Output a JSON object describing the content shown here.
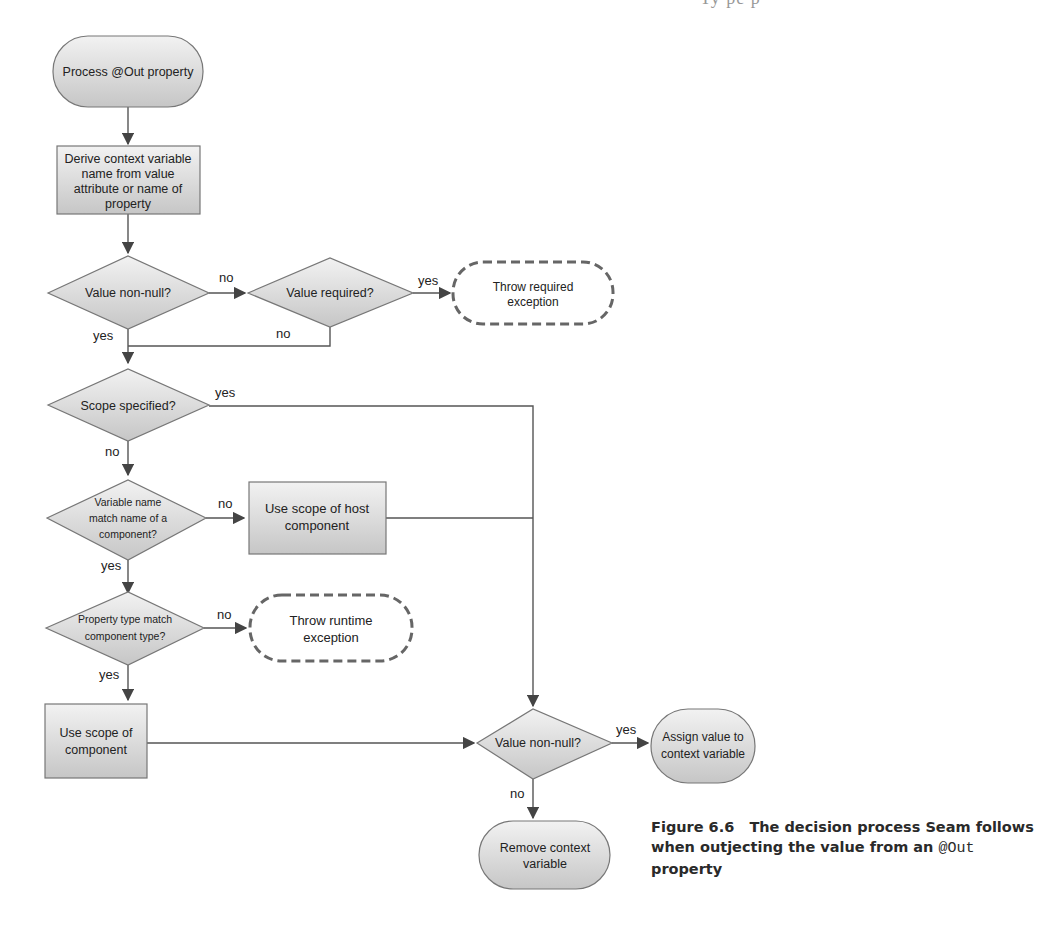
{
  "header_fragment": "Ty                      pe        p",
  "colors": {
    "node_fill_light": "#ececec",
    "node_fill_dark": "#c8c8c8",
    "stroke": "#6e6e6e",
    "dashed_stroke": "#666666",
    "line": "#555555"
  },
  "nodes": {
    "start": {
      "label": "Process @Out property"
    },
    "derive": {
      "lines": [
        "Derive context variable",
        "name from value",
        "attribute or name of",
        "property"
      ]
    },
    "value_non_null_1": {
      "label": "Value non-null?"
    },
    "value_required": {
      "label": "Value required?"
    },
    "throw_required": {
      "lines": [
        "Throw required",
        "exception"
      ]
    },
    "scope_specified": {
      "label": "Scope specified?"
    },
    "variable_name_match": {
      "lines": [
        "Variable name",
        "match name of a",
        "component?"
      ]
    },
    "use_host_scope": {
      "lines": [
        "Use scope of host",
        "component"
      ]
    },
    "property_type_match": {
      "lines": [
        "Property type match",
        "component type?"
      ]
    },
    "throw_runtime": {
      "lines": [
        "Throw runtime",
        "exception"
      ]
    },
    "use_component_scope": {
      "lines": [
        "Use scope of",
        "component"
      ]
    },
    "value_non_null_2": {
      "label": "Value non-null?"
    },
    "assign_value": {
      "lines": [
        "Assign value to",
        "context variable"
      ]
    },
    "remove_variable": {
      "lines": [
        "Remove context",
        "variable"
      ]
    }
  },
  "edge_labels": {
    "nn1_no": "no",
    "nn1_yes": "yes",
    "req_yes": "yes",
    "req_no": "no",
    "scope_yes": "yes",
    "scope_no": "no",
    "varmatch_no": "no",
    "varmatch_yes": "yes",
    "proptype_no": "no",
    "proptype_yes": "yes",
    "nn2_yes": "yes",
    "nn2_no": "no"
  },
  "caption": {
    "figure_number": "Figure 6.6",
    "text_before_code": "The decision process Seam follows when outjecting the value from an ",
    "code": "@Out",
    "text_after_code": " property"
  }
}
